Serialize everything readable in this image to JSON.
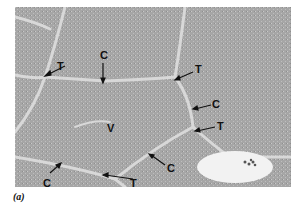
{
  "figure": {
    "caption": "(a)",
    "labels": [
      {
        "text": "T",
        "x": 57,
        "y": 61
      },
      {
        "text": "C",
        "x": 100,
        "y": 50
      },
      {
        "text": "T",
        "x": 195,
        "y": 64
      },
      {
        "text": "C",
        "x": 212,
        "y": 99
      },
      {
        "text": "V",
        "x": 107,
        "y": 123
      },
      {
        "text": "T",
        "x": 217,
        "y": 121
      },
      {
        "text": "C",
        "x": 167,
        "y": 163
      },
      {
        "text": "C",
        "x": 43,
        "y": 178
      },
      {
        "text": "T",
        "x": 130,
        "y": 178
      }
    ],
    "colors": {
      "tissue": "#a9a9a9",
      "septa": "#d8d8d8",
      "vessel": "#f2f2f2"
    }
  }
}
